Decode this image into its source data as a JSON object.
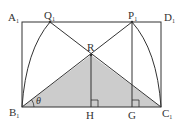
{
  "diagram": {
    "type": "geometry",
    "colors": {
      "line": "#333333",
      "shade": "#cccccc",
      "background": "#ffffff"
    },
    "points": {
      "A1": {
        "label": "A",
        "sub": "1",
        "x": 22,
        "y": 22
      },
      "D1": {
        "label": "D",
        "sub": "1",
        "x": 161,
        "y": 22
      },
      "B1": {
        "label": "B",
        "sub": "1",
        "x": 22,
        "y": 107
      },
      "C1": {
        "label": "C",
        "sub": "1",
        "x": 161,
        "y": 107
      },
      "Q1": {
        "label": "Q",
        "sub": "1",
        "x": 50,
        "y": 22
      },
      "P1": {
        "label": "P",
        "sub": "1",
        "x": 132,
        "y": 22
      },
      "R": {
        "label": "R",
        "x": 91,
        "y": 55
      },
      "H": {
        "label": "H",
        "x": 91,
        "y": 107
      },
      "G": {
        "label": "G",
        "x": 132,
        "y": 107
      }
    },
    "angle_label": "θ",
    "shaded_region": "triangle B1 R C1",
    "right_angles": [
      "H",
      "G"
    ]
  }
}
